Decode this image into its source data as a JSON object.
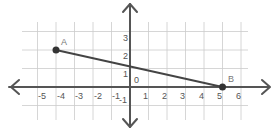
{
  "diagram": {
    "type": "coordinate-plane",
    "x_ticks": [
      "-5",
      "-4",
      "-3",
      "-2",
      "-1",
      "1",
      "2",
      "3",
      "4",
      "5",
      "6"
    ],
    "y_ticks": [
      "3",
      "2",
      "1",
      "-1"
    ],
    "origin_label": "0",
    "points": [
      {
        "label": "A",
        "x": -4,
        "y": 2
      },
      {
        "label": "B",
        "x": 5,
        "y": 0
      }
    ],
    "segment": {
      "from": "A",
      "to": "B"
    },
    "x_range": [
      -5,
      6
    ],
    "y_range": [
      -1,
      3
    ],
    "colors": {
      "axis": "#555555",
      "grid": "#c8c8c8",
      "segment": "#444444",
      "point": "#333333"
    }
  }
}
